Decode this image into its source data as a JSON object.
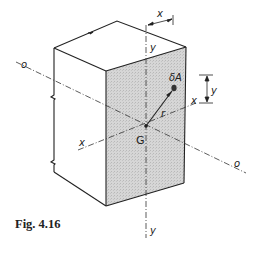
{
  "figure": {
    "caption": "Fig. 4.16",
    "labels": {
      "axis_o_left": "o",
      "axis_o_right": "o",
      "axis_x_left": "x",
      "axis_x_right": "x",
      "axis_y_top": "y",
      "axis_y_bottom": "y",
      "centroid": "G",
      "element_area": "δA",
      "radius": "r",
      "dim_x": "x",
      "dim_y": "y"
    },
    "colors": {
      "line": "#222222",
      "shaded_face": "#cfcfcf",
      "background": "#ffffff"
    }
  }
}
